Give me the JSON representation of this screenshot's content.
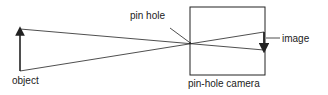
{
  "diagram": {
    "labels": {
      "pin_hole": "pin hole",
      "image": "image",
      "object": "object",
      "camera": "pin-hole camera"
    },
    "colors": {
      "line": "#222222",
      "background": "#ffffff"
    }
  }
}
